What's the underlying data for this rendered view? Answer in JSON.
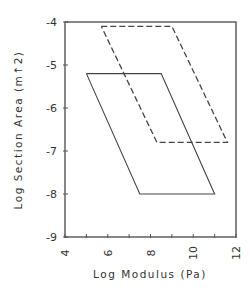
{
  "chart_data": {
    "type": "line",
    "title": "",
    "xlabel": "Log Modulus   (Pa)",
    "ylabel": "Log Section Area  (m↑2)",
    "xlim": [
      4,
      12
    ],
    "ylim": [
      -9,
      -4
    ],
    "xticks": [
      4,
      6,
      8,
      10,
      12
    ],
    "yticks": [
      -4,
      -5,
      -6,
      -7,
      -8,
      -9
    ],
    "xtick_labels": [
      "4",
      "6",
      "8",
      "10",
      "12"
    ],
    "ytick_labels": [
      "-4",
      "-5",
      "-6",
      "-7",
      "-8",
      "-9"
    ],
    "grid": false,
    "legend": null,
    "series": [
      {
        "name": "solid-region",
        "style": "solid",
        "x": [
          5.0,
          8.5,
          11.0,
          7.5,
          5.0
        ],
        "y": [
          -5.2,
          -5.2,
          -8.0,
          -8.0,
          -5.2
        ]
      },
      {
        "name": "dashed-region",
        "style": "dashed",
        "x": [
          5.7,
          9.0,
          11.6,
          8.3,
          5.7
        ],
        "y": [
          -4.1,
          -4.1,
          -6.8,
          -6.8,
          -4.1
        ]
      }
    ]
  },
  "colors": {
    "line": "#444444",
    "axis": "#555555",
    "text": "#333333"
  }
}
